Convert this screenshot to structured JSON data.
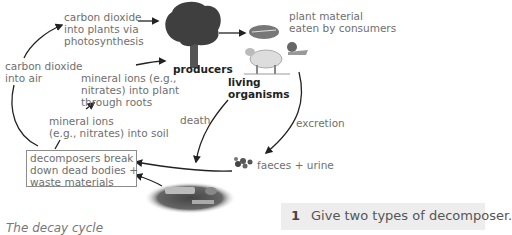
{
  "title": "The decay cycle",
  "nodes": {
    "producers": "producers",
    "living_organisms": [
      "living",
      "organisms"
    ],
    "decomposers_box": [
      "decomposers break",
      "down dead bodies +",
      "waste materials"
    ]
  },
  "labels": {
    "co2_into_plants": [
      "carbon dioxide",
      "into plants via",
      "photosynthesis"
    ],
    "plant_material": [
      "plant material",
      "eaten by consumers"
    ],
    "co2_into_air": [
      "carbon dioxide",
      "into air"
    ],
    "mineral_ions_plant": [
      "mineral ions (e.g.,",
      "nitrates) into plant",
      "through roots"
    ],
    "mineral_ions_soil": [
      "mineral ions",
      "(e.g., nitrates) into soil"
    ],
    "death": "death",
    "excretion": "excretion",
    "faeces_urine": "faeces + urine"
  },
  "question": {
    "number": "1",
    "text": "Give two types of decomposer."
  },
  "colors": {
    "label_text": "#6f6f6f",
    "arrow": "#222222",
    "question_bg": "#ededed"
  }
}
